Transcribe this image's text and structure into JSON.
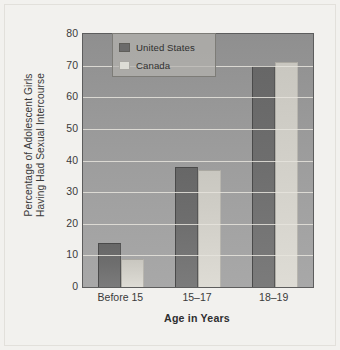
{
  "chart_data": {
    "type": "bar",
    "title": "",
    "xlabel": "Age in Years",
    "ylabel_lines": [
      "Percentage of Adolescent Girls",
      "Having Had Sexual Intercourse"
    ],
    "categories": [
      "Before 15",
      "15–17",
      "18–19"
    ],
    "series": [
      {
        "name": "United States",
        "values": [
          14,
          38,
          70
        ],
        "color": "#6b6b6b"
      },
      {
        "name": "Canada",
        "values": [
          9,
          37,
          71
        ],
        "color": "#ddddd6"
      }
    ],
    "ylim": [
      0,
      80
    ],
    "yticks": [
      0,
      10,
      20,
      30,
      40,
      50,
      60,
      70,
      80
    ],
    "ytick_labels": [
      "0",
      "10",
      "20",
      "30",
      "40",
      "50",
      "60",
      "70",
      "80"
    ],
    "grid": true,
    "legend_position": "top-left-inside",
    "plot_background": "#9a9a9a"
  }
}
